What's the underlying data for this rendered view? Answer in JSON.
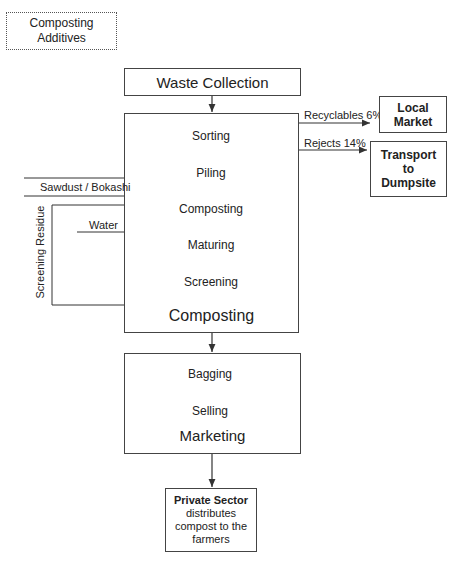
{
  "additives_box": {
    "line1": "Composting",
    "line2": "Additives"
  },
  "waste_collection": {
    "label": "Waste Collection"
  },
  "composting_stage": {
    "title": "Composting",
    "steps": [
      "Sorting",
      "Piling",
      "Composting",
      "Maturing",
      "Screening"
    ]
  },
  "outputs": {
    "recyclables": {
      "edge_label": "Recyclables 6%",
      "target": "Local Market"
    },
    "rejects": {
      "edge_label": "Rejects 14%",
      "target_lines": [
        "Transport",
        "to",
        "Dumpsite"
      ]
    }
  },
  "inputs": {
    "sawdust": "Sawdust / Bokashi",
    "water": "Water",
    "screening_residue": "Screening Residue"
  },
  "marketing_stage": {
    "title": "Marketing",
    "steps": [
      "Bagging",
      "Selling"
    ]
  },
  "private_sector": {
    "title": "Private Sector",
    "desc_lines": [
      "distributes",
      "compost to the",
      "farmers"
    ]
  }
}
